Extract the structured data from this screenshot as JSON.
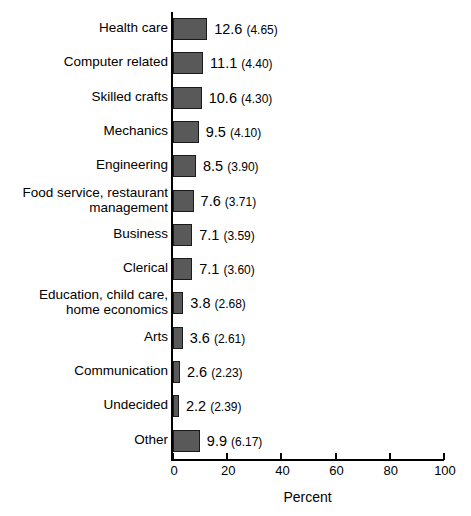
{
  "chart_data": {
    "type": "bar",
    "orientation": "horizontal",
    "title": "",
    "xlabel": "Percent",
    "ylabel": "",
    "xlim": [
      0,
      100
    ],
    "xticks": [
      0,
      20,
      40,
      60,
      80,
      100
    ],
    "xtick_labels": [
      "0",
      "20",
      "40",
      "60",
      "80",
      "100"
    ],
    "grid": false,
    "legend": null,
    "bar_color": "#595959",
    "bar_border_color": "#1a1a1a",
    "value_label_format": "mean (sd)",
    "categories": [
      "Health care",
      "Computer related",
      "Skilled crafts",
      "Mechanics",
      "Engineering",
      "Food service, restaurant\nmanagement",
      "Business",
      "Clerical",
      "Education, child care,\nhome economics",
      "Arts",
      "Communication",
      "Undecided",
      "Other"
    ],
    "values": [
      12.6,
      11.1,
      10.6,
      9.5,
      8.5,
      7.6,
      7.1,
      7.1,
      3.8,
      3.6,
      2.6,
      2.2,
      9.9
    ],
    "sd": [
      4.65,
      4.4,
      4.3,
      4.1,
      3.9,
      3.71,
      3.59,
      3.6,
      2.68,
      2.61,
      2.23,
      2.39,
      6.17
    ],
    "value_labels": [
      "12.6",
      "11.1",
      "10.6",
      "9.5",
      "8.5",
      "7.6",
      "7.1",
      "7.1",
      "3.8",
      "3.6",
      "2.6",
      "2.2",
      "9.9"
    ],
    "sd_labels": [
      "(4.65)",
      "(4.40)",
      "(4.30)",
      "(4.10)",
      "(3.90)",
      "(3.71)",
      "(3.59)",
      "(3.60)",
      "(2.68)",
      "(2.61)",
      "(2.23)",
      "(2.39)",
      "(6.17)"
    ]
  }
}
